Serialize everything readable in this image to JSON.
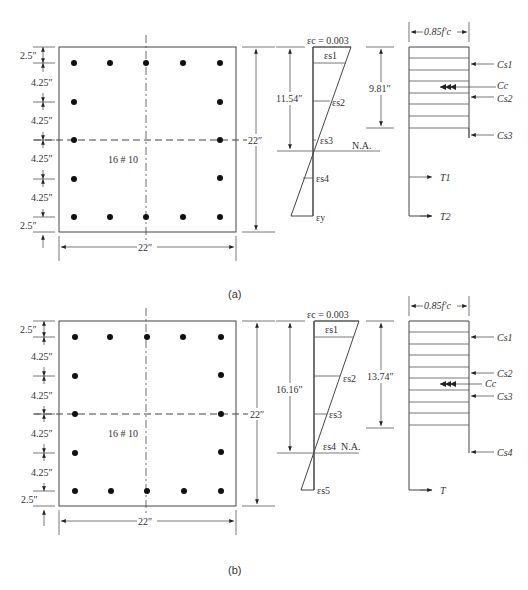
{
  "panels": [
    {
      "id": "a",
      "caption": "(a)",
      "section": {
        "width_label": "22″",
        "height_label": "22″",
        "bars_label": "16 # 10",
        "left_dims": [
          "2.5″",
          "4.25″",
          "4.25″",
          "4.25″",
          "4.25″",
          "2.5″"
        ]
      },
      "strain": {
        "top_label": "εc = 0.003",
        "depth_c_label": "11.54″",
        "depth_a_label": "9.81″",
        "na_label": "N.A.",
        "levels": [
          "εs1",
          "εs2",
          "εs3",
          "εs4",
          "εy"
        ]
      },
      "stress": {
        "top_label": "0.85f′c",
        "forces": [
          "Cs1",
          "Cc",
          "Cs2",
          "Cs3",
          "T1",
          "T2"
        ]
      }
    },
    {
      "id": "b",
      "caption": "(b)",
      "section": {
        "width_label": "22″",
        "height_label": "22″",
        "bars_label": "16 # 10",
        "left_dims": [
          "2.5″",
          "4.25″",
          "4.25″",
          "4.25″",
          "4.25″",
          "2.5″"
        ]
      },
      "strain": {
        "top_label": "εc = 0.003",
        "depth_c_label": "16.16″",
        "depth_a_label": "13.74″",
        "na_label": "N.A.",
        "levels": [
          "εs1",
          "εs2",
          "εs3",
          "εs4",
          "εs5"
        ]
      },
      "stress": {
        "top_label": "0.85f′c",
        "forces": [
          "Cs1",
          "Cs2",
          "Cc",
          "Cs3",
          "Cs4",
          "T"
        ]
      }
    }
  ]
}
